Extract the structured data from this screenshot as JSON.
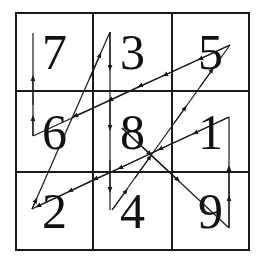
{
  "figure": {
    "type": "magic-square-path",
    "grid": {
      "rows": 3,
      "cols": 3,
      "cells": [
        [
          "7",
          "3",
          "5"
        ],
        [
          "6",
          "8",
          "1"
        ],
        [
          "2",
          "4",
          "9"
        ]
      ]
    },
    "path": {
      "order": [
        "8",
        "9",
        "1",
        "2",
        "3",
        "4",
        "5",
        "6",
        "7"
      ],
      "line_color": "#1a1a1a",
      "border_color": "#1a1a1a"
    }
  }
}
